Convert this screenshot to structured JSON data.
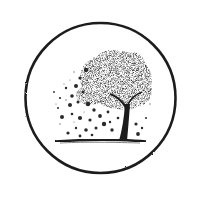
{
  "illustration": {
    "subject": "tree shedding leaves inside a circle",
    "colors": {
      "background": "#ffffff",
      "ink": "#1e1e1e",
      "ink_soft": "#3a3a3a",
      "ink_light": "#6a6a6a"
    },
    "circle": {
      "cx": 100.5,
      "cy": 98,
      "r": 75,
      "stroke_width": 2.6
    },
    "ground": {
      "x1": 55,
      "x2": 146,
      "y": 141
    },
    "trunk": {
      "base_x": 122,
      "base_y": 141,
      "top_x": 128,
      "top_y": 104
    },
    "canopy": {
      "cx": 118,
      "cy": 80,
      "rx": 34,
      "ry": 30
    }
  }
}
